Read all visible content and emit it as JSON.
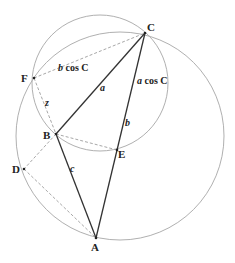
{
  "diagram": {
    "colors": {
      "background": "#ffffff",
      "solid_line": "#333333",
      "circle": "#b0b0b0",
      "dashed": "#a8a8a8",
      "text": "#222222"
    },
    "points": {
      "A": {
        "label": "A",
        "x": 96,
        "y": 238
      },
      "B": {
        "label": "B",
        "x": 56,
        "y": 134
      },
      "C": {
        "label": "C",
        "x": 145,
        "y": 33
      },
      "D": {
        "label": "D",
        "x": 24,
        "y": 169
      },
      "E": {
        "label": "E",
        "x": 117,
        "y": 150
      },
      "F": {
        "label": "F",
        "x": 34,
        "y": 78
      }
    },
    "circles": [
      {
        "name": "large-circle",
        "cx": 120,
        "cy": 136,
        "r": 104
      },
      {
        "name": "small-circle",
        "cx": 100,
        "cy": 83,
        "r": 68
      }
    ],
    "solid_segments": [
      [
        "A",
        "B"
      ],
      [
        "B",
        "C"
      ],
      [
        "C",
        "A"
      ]
    ],
    "dashed_segments": [
      [
        "F",
        "C"
      ],
      [
        "F",
        "B"
      ],
      [
        "B",
        "E"
      ],
      [
        "B",
        "D"
      ],
      [
        "D",
        "A"
      ]
    ],
    "side_labels": {
      "a": "a",
      "b": "b",
      "c": "c",
      "z": "z"
    },
    "expressions": {
      "b_cos_C": {
        "var": "b",
        "rest": " cos C"
      },
      "a_cos_C": {
        "var": "a",
        "rest": " cos C"
      }
    }
  }
}
